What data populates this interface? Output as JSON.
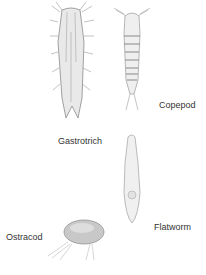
{
  "figure": {
    "labels": {
      "copepod": "Copepod",
      "gastrotrich": "Gastrotrich",
      "flatworm": "Flatworm",
      "ostracod": "Ostracod"
    },
    "caption_clipped": true,
    "colors": {
      "ink": "#333333",
      "body_shade": "#b8b8b8",
      "background": "#ffffff"
    }
  }
}
